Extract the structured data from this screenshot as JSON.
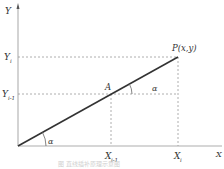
{
  "diagram": {
    "axes": {
      "y_label": "Y",
      "x_label": "X"
    },
    "points": {
      "p_label": "P(x,y)",
      "a_label": "A"
    },
    "ticks": {
      "y_i": "Y",
      "y_i_sub": "i",
      "y_i1": "Y",
      "y_i1_sub": "i-1",
      "x_i1": "X",
      "x_i1_sub": "i-1",
      "x_i": "X",
      "x_i_sub": "i"
    },
    "angles": {
      "alpha_origin": "α",
      "alpha_a": "α"
    },
    "caption": "图 直线插补原理示意图",
    "colors": {
      "axis": "#c8c8c8",
      "line": "#333333",
      "dash": "#9a9a9a"
    }
  }
}
